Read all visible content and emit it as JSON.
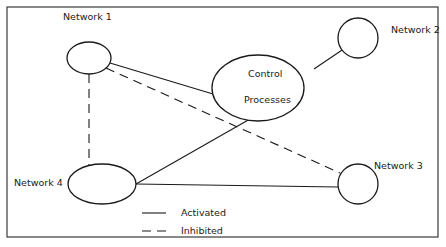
{
  "diagram": {
    "nodes": [
      {
        "id": "network1",
        "label": "Network  1"
      },
      {
        "id": "network2",
        "label": "Network 2"
      },
      {
        "id": "network3",
        "label": "Network 3"
      },
      {
        "id": "network4",
        "label": "Network 4"
      },
      {
        "id": "control",
        "label_line1": "Control",
        "label_line2": "Processes"
      }
    ],
    "edges": [
      {
        "from": "network1",
        "to": "control",
        "type": "activated"
      },
      {
        "from": "network2",
        "to": "control",
        "type": "activated"
      },
      {
        "from": "network4",
        "to": "control",
        "type": "activated"
      },
      {
        "from": "network4",
        "to": "network3",
        "type": "activated"
      },
      {
        "from": "network1",
        "to": "network4",
        "type": "inhibited"
      },
      {
        "from": "network1",
        "to": "network3",
        "type": "inhibited"
      }
    ],
    "legend": {
      "activated": "Activated",
      "inhibited": "Inhibited"
    }
  }
}
